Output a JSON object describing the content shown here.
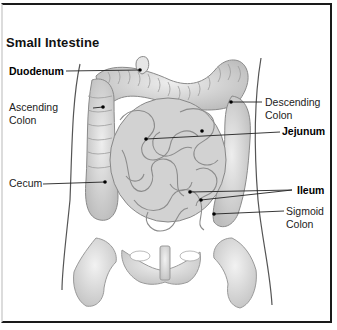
{
  "diagram": {
    "title": "Small Intestine",
    "labels": {
      "duodenum": "Duodenum",
      "ascending_colon_1": "Ascending",
      "ascending_colon_2": "Colon",
      "cecum": "Cecum",
      "descending_colon_1": "Descending",
      "descending_colon_2": "Colon",
      "jejunum": "Jejunum",
      "ileum": "Ileum",
      "sigmoid_colon_1": "Sigmoid",
      "sigmoid_colon_2": "Colon"
    },
    "colors": {
      "frame": "#1a1a1a",
      "organ_fill": "#d6d6d6",
      "organ_stroke": "#8a8a8a",
      "bone_fill": "#e2e2e2",
      "leader_line": "#222222"
    }
  }
}
